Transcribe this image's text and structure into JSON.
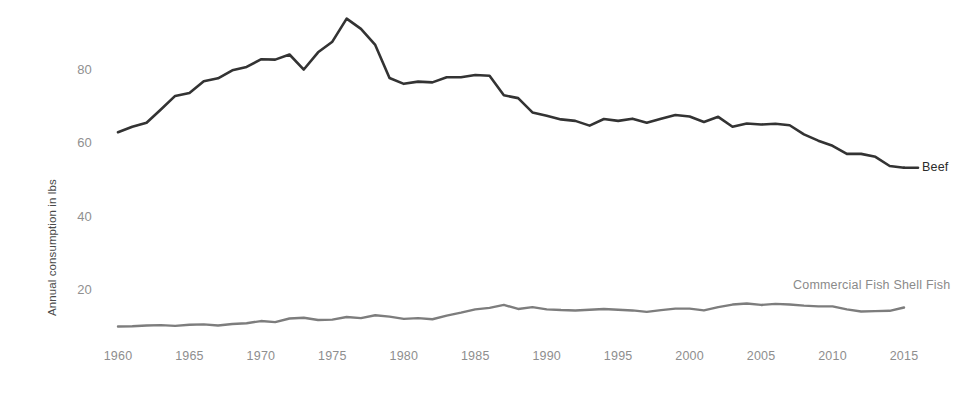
{
  "chart_data": {
    "type": "line",
    "title": "",
    "xlabel": "",
    "ylabel": "Annual consumption in lbs",
    "xlim": [
      1960,
      2015
    ],
    "ylim": [
      0,
      100
    ],
    "grid": false,
    "legend_position": "right-inline-labels",
    "x_ticks": [
      "1960",
      "1965",
      "1970",
      "1975",
      "1980",
      "1985",
      "1990",
      "1995",
      "2000",
      "2005",
      "2010",
      "2015"
    ],
    "y_ticks": [
      "20",
      "40",
      "60",
      "80"
    ],
    "x": [
      1960,
      1961,
      1962,
      1963,
      1964,
      1965,
      1966,
      1967,
      1968,
      1969,
      1970,
      1971,
      1972,
      1973,
      1974,
      1975,
      1976,
      1977,
      1978,
      1979,
      1980,
      1981,
      1982,
      1983,
      1984,
      1985,
      1986,
      1987,
      1988,
      1989,
      1990,
      1991,
      1992,
      1993,
      1994,
      1995,
      1996,
      1997,
      1998,
      1999,
      2000,
      2001,
      2002,
      2003,
      2004,
      2005,
      2006,
      2007,
      2008,
      2009,
      2010,
      2011,
      2012,
      2013,
      2014,
      2015
    ],
    "series": [
      {
        "name": "Beef",
        "color": "#333333",
        "label_x": 2016,
        "label_y": 53.5,
        "values": [
          63.3,
          64.8,
          65.9,
          69.5,
          73.2,
          74.0,
          77.2,
          78.0,
          80.2,
          81.1,
          83.2,
          83.1,
          84.5,
          80.4,
          85.1,
          88.0,
          94.3,
          91.5,
          87.1,
          78.1,
          76.5,
          77.1,
          76.9,
          78.3,
          78.3,
          78.9,
          78.7,
          73.4,
          72.6,
          68.7,
          67.8,
          66.8,
          66.4,
          65.1,
          66.9,
          66.4,
          67.0,
          65.9,
          67.0,
          68.0,
          67.6,
          66.1,
          67.5,
          64.8,
          65.7,
          65.4,
          65.6,
          65.2,
          62.7,
          61.0,
          59.6,
          57.4,
          57.4,
          56.6,
          54.1,
          53.6
        ]
      },
      {
        "name": "Commercial Fish Shell Fish",
        "color": "#7d7d7d",
        "label_x": 2010,
        "label_y": 21.5,
        "values": [
          10.3,
          10.4,
          10.6,
          10.7,
          10.5,
          10.8,
          10.9,
          10.6,
          11.0,
          11.2,
          11.8,
          11.5,
          12.5,
          12.7,
          12.1,
          12.2,
          12.9,
          12.6,
          13.4,
          13.0,
          12.4,
          12.6,
          12.3,
          13.3,
          14.1,
          15.0,
          15.4,
          16.2,
          15.1,
          15.6,
          15.0,
          14.8,
          14.7,
          14.9,
          15.1,
          14.9,
          14.7,
          14.3,
          14.8,
          15.2,
          15.2,
          14.7,
          15.6,
          16.3,
          16.6,
          16.2,
          16.5,
          16.3,
          16.0,
          15.8,
          15.8,
          15.0,
          14.4,
          14.5,
          14.6,
          15.5
        ]
      }
    ]
  },
  "axis": {
    "y_title": "Annual consumption in lbs"
  }
}
